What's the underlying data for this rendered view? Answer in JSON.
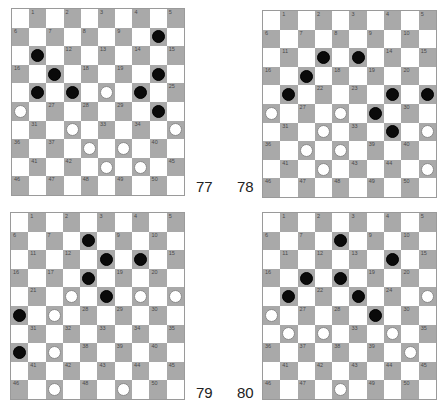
{
  "colors": {
    "dark_square": "#a9a9a9",
    "light_square": "#ffffff",
    "black_piece": "#0a0a0a",
    "white_piece": "#ffffff"
  },
  "boards": [
    {
      "label": "77",
      "pos": {
        "x": 11,
        "y": 8,
        "w": 174,
        "h": 188
      },
      "label_pos": {
        "x": 196,
        "y": 179
      },
      "black": [
        10,
        11,
        17,
        20,
        21,
        22,
        24,
        30
      ],
      "white": [
        23,
        26,
        32,
        35,
        38,
        39,
        43,
        44
      ]
    },
    {
      "label": "78",
      "pos": {
        "x": 262,
        "y": 10,
        "w": 175,
        "h": 188
      },
      "label_pos": {
        "x": 237,
        "y": 179
      },
      "black": [
        12,
        13,
        17,
        21,
        24,
        25,
        29,
        34
      ],
      "white": [
        26,
        28,
        32,
        35,
        37,
        38,
        42,
        45
      ]
    },
    {
      "label": "79",
      "pos": {
        "x": 10,
        "y": 212,
        "w": 175,
        "h": 188
      },
      "label_pos": {
        "x": 196,
        "y": 385
      },
      "black": [
        8,
        13,
        14,
        18,
        23,
        26,
        36
      ],
      "white": [
        22,
        24,
        25,
        27,
        37,
        47,
        49
      ]
    },
    {
      "label": "80",
      "pos": {
        "x": 262,
        "y": 212,
        "w": 175,
        "h": 188
      },
      "label_pos": {
        "x": 237,
        "y": 385
      },
      "black": [
        8,
        14,
        17,
        18,
        21,
        23,
        29
      ],
      "white": [
        25,
        26,
        31,
        32,
        34,
        40,
        48
      ]
    }
  ]
}
